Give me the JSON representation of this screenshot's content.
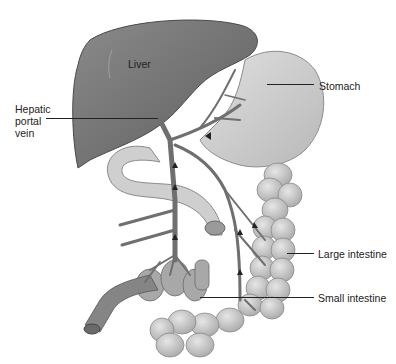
{
  "diagram": {
    "labels": {
      "liver": "Liver",
      "hepatic_portal_vein_line1": "Hepatic",
      "hepatic_portal_vein_line2": "portal",
      "hepatic_portal_vein_line3": "vein",
      "stomach": "Stomach",
      "large_intestine": "Large intestine",
      "small_intestine": "Small intestine"
    },
    "colors": {
      "liver": "#6e6e6e",
      "liver_edge": "#4a4a4a",
      "stomach": "#c9c9c9",
      "intestine": "#c4c4c4",
      "vein": "#7a7a7a",
      "leader_line": "#222222",
      "background": "#ffffff"
    }
  }
}
